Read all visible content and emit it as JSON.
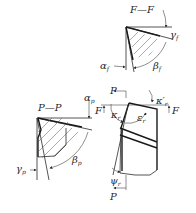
{
  "sections": {
    "ff": {
      "title": "F—F",
      "gamma": "γ",
      "gamma_sub": "f",
      "alpha": "α",
      "alpha_sub": "f",
      "beta": "β",
      "beta_sub": "f"
    },
    "pp": {
      "title": "P—P",
      "alpha": "α",
      "alpha_sub": "p",
      "gamma": "γ",
      "gamma_sub": "p",
      "beta": "β",
      "beta_sub": "p"
    },
    "plan": {
      "P_top": "P",
      "P_bottom": "P",
      "F_left": "F",
      "F_right": "F",
      "kappa": "κ",
      "kappa_sub": "r",
      "kappa_prime": "κ′",
      "kappa_prime_sub": "r",
      "epsilon": "ε",
      "epsilon_sub": "r",
      "psi": "ψ",
      "psi_sub": "r"
    }
  }
}
